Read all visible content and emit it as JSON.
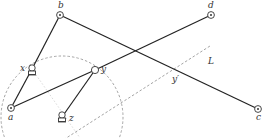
{
  "diagram": {
    "type": "linkage-mechanism",
    "colors": {
      "link": "#222222",
      "construction": "#9a9a9a",
      "background": "#ffffff"
    },
    "nodes": [
      {
        "id": "a",
        "label": "a",
        "kind": "fixed-pivot",
        "x": 11,
        "y": 108
      },
      {
        "id": "b",
        "label": "b",
        "kind": "fixed-pivot",
        "x": 60,
        "y": 15
      },
      {
        "id": "c",
        "label": "c",
        "kind": "fixed-pivot",
        "x": 258,
        "y": 109
      },
      {
        "id": "d",
        "label": "d",
        "kind": "fixed-pivot",
        "x": 211,
        "y": 15
      },
      {
        "id": "x",
        "label": "x",
        "kind": "slider-joint",
        "x": 32,
        "y": 69
      },
      {
        "id": "y",
        "label": "y",
        "kind": "joint",
        "x": 95,
        "y": 70
      },
      {
        "id": "z",
        "label": "z",
        "kind": "slider-joint",
        "x": 62,
        "y": 117
      }
    ],
    "links": [
      {
        "from": "b",
        "to": "x"
      },
      {
        "from": "x",
        "to": "a"
      },
      {
        "from": "b",
        "to": "c"
      },
      {
        "from": "a",
        "to": "y"
      },
      {
        "from": "y",
        "to": "d"
      },
      {
        "from": "y",
        "to": "z"
      }
    ],
    "construction": {
      "circle": {
        "cx": 62,
        "cy": 117,
        "r": 61
      },
      "line_L": {
        "label": "L",
        "x1": 60,
        "y1": 142,
        "x2": 210,
        "y2": 46
      },
      "point_y_prime": {
        "label": "y′",
        "x": 176,
        "y": 75
      }
    },
    "labels": {
      "a": "a",
      "b": "b",
      "c": "c",
      "d": "d",
      "x": "x",
      "y": "y",
      "z": "z",
      "L": "L",
      "y_prime": "y′"
    }
  }
}
